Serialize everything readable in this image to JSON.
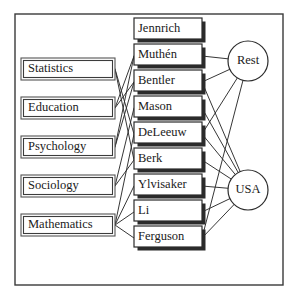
{
  "diagram": {
    "type": "tripartite-graph",
    "title": "",
    "frame": {
      "x": 15,
      "y": 14,
      "width": 268,
      "height": 271
    },
    "columns": {
      "left": {
        "name": "disciplines",
        "box_width": 94,
        "box_height": 22,
        "x": 21,
        "nodes": [
          {
            "id": "statistics",
            "label": "Statistics",
            "y": 58
          },
          {
            "id": "education",
            "label": "Education",
            "y": 97
          },
          {
            "id": "psychology",
            "label": "Psychology",
            "y": 136
          },
          {
            "id": "sociology",
            "label": "Sociology",
            "y": 175
          },
          {
            "id": "mathematics",
            "label": "Mathematics",
            "y": 214
          }
        ]
      },
      "middle": {
        "name": "people",
        "box_width": 68,
        "box_height": 24,
        "x": 134,
        "nodes": [
          {
            "id": "jennrich",
            "label": "Jennrich",
            "y": 18
          },
          {
            "id": "muthen",
            "label": "Muthén",
            "y": 44
          },
          {
            "id": "bentler",
            "label": "Bentler",
            "y": 70
          },
          {
            "id": "mason",
            "label": "Mason",
            "y": 96
          },
          {
            "id": "deleeuw",
            "label": "DeLeeuw",
            "y": 122
          },
          {
            "id": "berk",
            "label": "Berk",
            "y": 148
          },
          {
            "id": "ylvisaker",
            "label": "Ylvisaker",
            "y": 174
          },
          {
            "id": "li",
            "label": "Li",
            "y": 200
          },
          {
            "id": "ferguson",
            "label": "Ferguson",
            "y": 226
          }
        ]
      },
      "right": {
        "name": "locations",
        "radius": 20,
        "cx": 248,
        "nodes": [
          {
            "id": "rest",
            "label": "Rest",
            "cy": 61
          },
          {
            "id": "usa",
            "label": "USA",
            "cy": 190
          }
        ]
      }
    },
    "edges_left_middle": [
      {
        "from": "statistics",
        "to": "deleeuw"
      },
      {
        "from": "statistics",
        "to": "berk"
      },
      {
        "from": "education",
        "to": "muthen"
      },
      {
        "from": "education",
        "to": "bentler"
      },
      {
        "from": "psychology",
        "to": "muthen"
      },
      {
        "from": "psychology",
        "to": "bentler"
      },
      {
        "from": "sociology",
        "to": "mason"
      },
      {
        "from": "sociology",
        "to": "berk"
      },
      {
        "from": "mathematics",
        "to": "deleeuw"
      },
      {
        "from": "mathematics",
        "to": "ylvisaker"
      },
      {
        "from": "mathematics",
        "to": "li"
      },
      {
        "from": "mathematics",
        "to": "ferguson"
      }
    ],
    "edges_middle_right": [
      {
        "from": "muthen",
        "to": "rest"
      },
      {
        "from": "bentler",
        "to": "rest"
      },
      {
        "from": "bentler",
        "to": "usa"
      },
      {
        "from": "mason",
        "to": "usa"
      },
      {
        "from": "deleeuw",
        "to": "rest"
      },
      {
        "from": "deleeuw",
        "to": "usa"
      },
      {
        "from": "berk",
        "to": "usa"
      },
      {
        "from": "ylvisaker",
        "to": "usa"
      },
      {
        "from": "li",
        "to": "usa"
      },
      {
        "from": "ferguson",
        "to": "rest"
      },
      {
        "from": "ferguson",
        "to": "usa"
      }
    ],
    "colors": {
      "background": "#ffffff",
      "frame_stroke": "#3a3a3a",
      "box_stroke": "#2b2b2b",
      "shadow": "#2b2b2b",
      "edge": "#2b2b2b",
      "text": "#1a1a1a"
    }
  }
}
